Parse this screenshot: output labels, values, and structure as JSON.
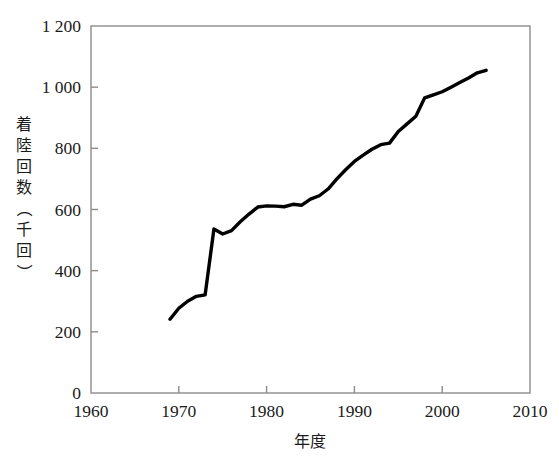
{
  "chart_data": {
    "type": "line",
    "title": "",
    "xlabel": "年度",
    "ylabel": "着陸回数（千回）",
    "xlim": [
      1960,
      2010
    ],
    "ylim": [
      0,
      1200
    ],
    "xticks": [
      1960,
      1970,
      1980,
      1990,
      2000,
      2010
    ],
    "xtick_labels": [
      "1960",
      "1970",
      "1980",
      "1990",
      "2000",
      "2010"
    ],
    "yticks": [
      0,
      200,
      400,
      600,
      800,
      1000,
      1200
    ],
    "ytick_labels": [
      "0",
      "200",
      "400",
      "600",
      "800",
      "1 000",
      "1 200"
    ],
    "grid": false,
    "legend": null,
    "line_color": "#000000",
    "line_width": 3.4,
    "frame_color": "#8c8c8c",
    "series": [
      {
        "name": "着陸回数",
        "x": [
          1969,
          1970,
          1971,
          1972,
          1973,
          1974,
          1975,
          1976,
          1977,
          1978,
          1979,
          1980,
          1981,
          1982,
          1983,
          1984,
          1985,
          1986,
          1987,
          1988,
          1989,
          1990,
          1991,
          1992,
          1993,
          1994,
          1995,
          1996,
          1997,
          1998,
          1999,
          2000,
          2001,
          2002,
          2003,
          2004,
          2005
        ],
        "values": [
          241,
          277,
          300,
          316,
          321,
          536,
          520,
          531,
          560,
          585,
          608,
          612,
          611,
          609,
          617,
          614,
          634,
          645,
          667,
          700,
          730,
          757,
          778,
          797,
          812,
          817,
          855,
          880,
          905,
          965,
          975,
          985,
          1000,
          1015,
          1030,
          1047,
          1055
        ]
      }
    ]
  },
  "axis_title_y_chars": [
    "着",
    "陸",
    "回",
    "数",
    "（",
    "千",
    "回",
    "）"
  ]
}
